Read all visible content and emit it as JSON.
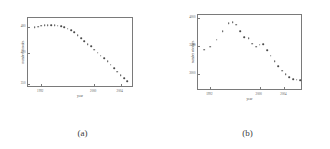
{
  "figure": {
    "panels": [
      {
        "caption": "(a)"
      },
      {
        "caption": "(b)"
      }
    ]
  },
  "chart_data": [
    {
      "type": "scatter",
      "panel": "(a)",
      "title": "",
      "xlabel": "year",
      "ylabel": "number of nodes",
      "xlim": [
        1990,
        2006
      ],
      "ylim": [
        340,
        500
      ],
      "xticks": [
        1992,
        2000,
        2004
      ],
      "xticklabels": [
        "1992",
        "2000",
        "2004"
      ],
      "yticks": [
        350,
        420,
        480
      ],
      "yticklabels": [
        "350",
        "420",
        "480"
      ],
      "grid": false,
      "legend": false,
      "x": [
        1991,
        1991.5,
        1992,
        1992.5,
        1993,
        1993.5,
        1994,
        1994.5,
        1995,
        1995.5,
        1996,
        1996.5,
        1997,
        1997.5,
        1998,
        1998.5,
        1999,
        1999.5,
        2000,
        2000.5,
        2001,
        2001.5,
        2002,
        2002.5,
        2003,
        2003.5,
        2004,
        2004.5,
        2005
      ],
      "y": [
        479,
        480,
        482,
        483,
        484,
        484,
        483,
        482,
        481,
        479,
        476,
        472,
        467,
        461,
        454,
        447,
        440,
        435,
        428,
        421,
        414,
        408,
        401,
        393,
        385,
        377,
        369,
        362,
        356
      ]
    },
    {
      "type": "scatter",
      "panel": "(b)",
      "title": "",
      "xlabel": "year",
      "ylabel": "number of edges",
      "xlim": [
        1990,
        2007
      ],
      "ylim": [
        2700,
        4050
      ],
      "xticks": [
        1992,
        2000,
        2004
      ],
      "xticklabels": [
        "1992",
        "2000",
        "2004"
      ],
      "yticks": [
        3000,
        3500,
        4000
      ],
      "yticklabels": [
        "3000",
        "3500",
        "4000"
      ],
      "grid": false,
      "legend": false,
      "x": [
        1991,
        1992,
        1993,
        1994,
        1995,
        1995.6,
        1996.2,
        1996.8,
        1997.5,
        1998.2,
        1998.8,
        1999.4,
        2000,
        2000.6,
        2001.2,
        2001.8,
        2002.4,
        2003,
        2003.6,
        2004.2,
        2004.8,
        2005.4,
        2006,
        2006.5
      ],
      "y": [
        3430,
        3490,
        3610,
        3760,
        3900,
        3920,
        3880,
        3760,
        3660,
        3640,
        3540,
        3490,
        3520,
        3530,
        3420,
        3330,
        3230,
        3140,
        3060,
        3000,
        2950,
        2910,
        2900,
        2895
      ]
    }
  ]
}
